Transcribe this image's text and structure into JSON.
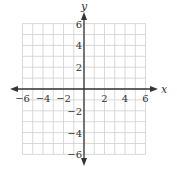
{
  "chart_data": {
    "type": "scatter",
    "title": "",
    "xlabel": "x",
    "ylabel": "y",
    "xlim": [
      -6,
      6
    ],
    "ylim": [
      -6,
      6
    ],
    "grid": true,
    "grid_step": 1,
    "x_ticks": [
      -6,
      -4,
      -2,
      2,
      4,
      6
    ],
    "y_ticks": [
      6,
      4,
      2,
      -2,
      -4,
      -6
    ],
    "x_tick_labels": [
      "−6",
      "−4",
      "−2",
      "2",
      "4",
      "6"
    ],
    "y_tick_labels": [
      "6",
      "4",
      "2",
      "−2",
      "−4",
      "−6"
    ],
    "series": [],
    "legend": null
  },
  "colors": {
    "grid": "#cfcfcf",
    "axis": "#333333",
    "background": "#ffffff"
  }
}
